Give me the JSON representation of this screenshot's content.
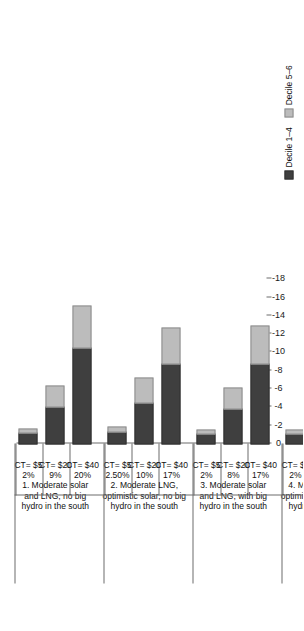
{
  "chart_data": {
    "type": "bar",
    "orientation": "horizontal-stacked-negative",
    "title": "",
    "xlabel": "",
    "ylabel": "",
    "xlim": [
      0,
      -18
    ],
    "grid": false,
    "legend_position": "bottom-right",
    "tick_labels": [
      "0",
      "-2",
      "-4",
      "-6",
      "-8",
      "-10",
      "-12",
      "-14",
      "-16",
      "-18"
    ],
    "tick_values": [
      0,
      -2,
      -4,
      -6,
      -8,
      -10,
      -12,
      -14,
      -16,
      -18
    ],
    "series": [
      {
        "name": "Decile 1–4",
        "color": "#3f3f3f"
      },
      {
        "name": "Decile 5–6",
        "color": "#bcbcbc"
      }
    ],
    "groups": [
      {
        "title": "1. Moderate solar and LNG, no big hydro in the south",
        "title_lines": [
          "1. Moderate solar",
          "and LNG, no big",
          "hydro in the south"
        ],
        "categories": [
          {
            "ct": "CT= $5",
            "pct": "2%",
            "decile_1_4": -1.3,
            "decile_5_6": -0.6,
            "total": -1.9
          },
          {
            "ct": "CT= $20",
            "pct": "9%",
            "decile_1_4": -4.2,
            "decile_5_6": -2.4,
            "total": -6.6
          },
          {
            "ct": "CT= $40",
            "pct": "20%",
            "decile_1_4": -10.6,
            "decile_5_6": -4.7,
            "total": -15.3
          }
        ]
      },
      {
        "title": "2. Moderate LNG, optimistic solar, no big hydro in the south",
        "title_lines": [
          "2. Moderate LNG,",
          "optimistic solar, no big",
          "hydro in the south"
        ],
        "categories": [
          {
            "ct": "CT= $5",
            "pct": "2.50%",
            "decile_1_4": -1.4,
            "decile_5_6": -0.7,
            "total": -2.1
          },
          {
            "ct": "CT= $20",
            "pct": "10%",
            "decile_1_4": -4.6,
            "decile_5_6": -2.8,
            "total": -7.4
          },
          {
            "ct": "CT= $40",
            "pct": "17%",
            "decile_1_4": -8.8,
            "decile_5_6": -4.1,
            "total": -12.9
          }
        ]
      },
      {
        "title": "3. Moderate solar and LNG, with big hydro in the south",
        "title_lines": [
          "3. Moderate solar",
          "and LNG, with big",
          "hydro in the south"
        ],
        "categories": [
          {
            "ct": "CT= $5",
            "pct": "2%",
            "decile_1_4": -1.2,
            "decile_5_6": -0.6,
            "total": -1.8
          },
          {
            "ct": "CT= $20",
            "pct": "8%",
            "decile_1_4": -3.9,
            "decile_5_6": -2.4,
            "total": -6.3
          },
          {
            "ct": "CT= $40",
            "pct": "17%",
            "decile_1_4": -8.9,
            "decile_5_6": -4.2,
            "total": -13.1
          }
        ]
      },
      {
        "title": "4. Moderate solar, optimistic LNG, no big hydro in the south",
        "title_lines": [
          "4. Moderate solar,",
          "optimistic LNG, no big",
          "hydro in the south"
        ],
        "categories": [
          {
            "ct": "CT= $5",
            "pct": "2%",
            "decile_1_4": -1.2,
            "decile_5_6": -0.6,
            "total": -1.8
          },
          {
            "ct": "CT= $20",
            "pct": "9%",
            "decile_1_4": -4.2,
            "decile_5_6": -2.9,
            "total": -7.1
          },
          {
            "ct": "CT= $40",
            "pct": "23%",
            "decile_1_4": -10.2,
            "decile_5_6": -5.2,
            "total": -15.4
          }
        ]
      }
    ]
  },
  "colors": {
    "decile_1_4": "#3f3f3f",
    "decile_5_6": "#bcbcbc",
    "axis": "#6d6d6d",
    "text": "#111111",
    "background": "#ffffff"
  }
}
